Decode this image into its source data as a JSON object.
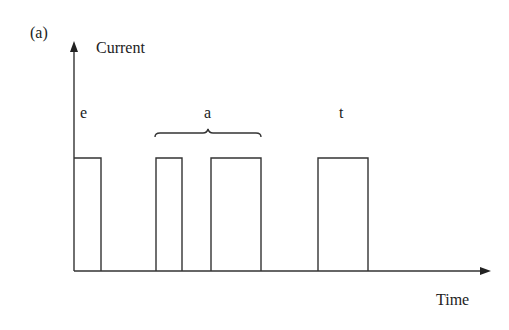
{
  "figure": {
    "panel_label": "(a)",
    "y_axis_label": "Current",
    "x_axis_label": "Time",
    "line_color": "#333333"
  },
  "pulses": [
    {
      "letter": "e",
      "segments": [
        [
          74,
          101
        ]
      ]
    },
    {
      "letter": "a",
      "segments": [
        [
          156,
          182
        ],
        [
          211,
          261
        ]
      ],
      "brace": true
    },
    {
      "letter": "t",
      "segments": [
        [
          318,
          368
        ]
      ]
    }
  ]
}
